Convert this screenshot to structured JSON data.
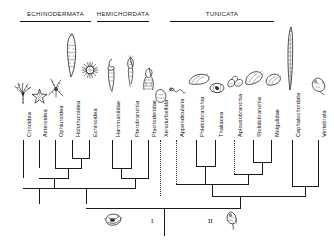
{
  "figure": {
    "type": "cladogram"
  },
  "groups": [
    {
      "id": "echinodermata",
      "label": "ECHINODERMATA",
      "bar_x": 20,
      "bar_width": 71,
      "bar_y": 20,
      "label_x": 20,
      "label_y": 10
    },
    {
      "id": "hemichordata",
      "label": "HEMICHORDATA",
      "bar_x": 97,
      "bar_width": 52,
      "bar_y": 20,
      "label_x": 92,
      "label_y": 10
    },
    {
      "id": "tunicata",
      "label": "TUNICATA",
      "bar_x": 170,
      "bar_width": 104,
      "bar_y": 20,
      "label_x": 188,
      "label_y": 10
    }
  ],
  "tips": [
    {
      "id": "crinoidea",
      "label": "Crinoidea",
      "x": 23,
      "label_y": 136,
      "tip_y": 126,
      "sketch": "crinoid"
    },
    {
      "id": "asteroidea",
      "label": "Asteroidea",
      "x": 39,
      "label_y": 136,
      "tip_y": 121,
      "sketch": "sea-star"
    },
    {
      "id": "ophiuroidea",
      "label": "Ophiuroidea",
      "x": 55,
      "label_y": 136,
      "tip_y": 116,
      "sketch": "brittle-star"
    },
    {
      "id": "holothuroidea",
      "label": "Holothuroidea",
      "x": 72,
      "label_y": 136,
      "tip_y": 112,
      "sketch": "sea-cucumber"
    },
    {
      "id": "echinoidea",
      "label": "Echinoidea",
      "x": 89,
      "label_y": 136,
      "tip_y": 116,
      "sketch": "sea-urchin"
    },
    {
      "id": "harrimaniidae",
      "label": "Harrimaniidae",
      "x": 112,
      "label_y": 136,
      "tip_y": 118,
      "sketch": "acorn-worm"
    },
    {
      "id": "pterobranchia",
      "label": "Pterobranchia",
      "x": 131,
      "label_y": 136,
      "tip_y": 114,
      "sketch": "pterobranch"
    },
    {
      "id": "ptychoderidae",
      "label": "Ptychoderidae",
      "x": 148,
      "label_y": 136,
      "tip_y": 123,
      "sketch": "ptychoderid"
    },
    {
      "id": "xenoturbellida",
      "label": "Xenoturbellida",
      "x": 160,
      "label_y": 136,
      "tip_y": 128,
      "sketch": "xenoturbella"
    },
    {
      "id": "appendicularia",
      "label": "Appendicularia",
      "x": 176,
      "label_y": 136,
      "tip_y": 128,
      "sketch": "larvacean"
    },
    {
      "id": "phlebobranchia",
      "label": "Phlebobranchia",
      "x": 196,
      "label_y": 136,
      "tip_y": 120,
      "sketch": "phlebobranch"
    },
    {
      "id": "thaliacea",
      "label": "Thaliacea",
      "x": 215,
      "label_y": 136,
      "tip_y": 119,
      "sketch": "salp"
    },
    {
      "id": "aplousobranchia",
      "label": "Aplousobranchia",
      "x": 234,
      "label_y": 136,
      "tip_y": 123,
      "sketch": "aplousobranch"
    },
    {
      "id": "stolidobranchia",
      "label": "Stolidobranchia",
      "x": 253,
      "label_y": 136,
      "tip_y": 120,
      "sketch": "stolidobranch"
    },
    {
      "id": "molgulidae",
      "label": "Molgulidae",
      "x": 271,
      "label_y": 136,
      "tip_y": 120,
      "sketch": "molgulid"
    },
    {
      "id": "cephalochordata",
      "label": "Cephalochordata",
      "x": 292,
      "label_y": 136,
      "tip_y": 108,
      "sketch": "amphioxus"
    },
    {
      "id": "vertebrata",
      "label": "Vertebrata",
      "x": 318,
      "label_y": 136,
      "tip_y": 120,
      "sketch": "vertebrate-embryo"
    }
  ],
  "base": {
    "numerals": [
      {
        "id": "numeral-one",
        "label": "I",
        "x": 150,
        "y": 222
      },
      {
        "id": "numeral-two",
        "label": "II",
        "x": 212,
        "y": 222
      }
    ],
    "sketches": [
      {
        "id": "base-larva-left",
        "name": "dipleurula-larva-sketch",
        "x": 110,
        "y": 214
      },
      {
        "id": "base-larva-right",
        "name": "tadpole-larva-sketch",
        "x": 228,
        "y": 214
      }
    ]
  },
  "colors": {
    "stroke": "#1a1a1a",
    "text": "#111111",
    "background": "#ffffff"
  }
}
